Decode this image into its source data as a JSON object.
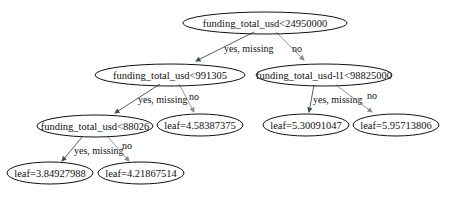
{
  "tree": {
    "nodes": [
      {
        "id": "n0",
        "label": "funding_total_usd<24950000",
        "type": "split"
      },
      {
        "id": "n1",
        "label": "funding_total_usd<991305",
        "type": "split"
      },
      {
        "id": "n2",
        "label": "funding_total_usd-l1<98825000",
        "type": "split"
      },
      {
        "id": "n3",
        "label": "funding_total_usd<88026",
        "type": "split"
      },
      {
        "id": "n4",
        "label": "leaf=4.58387375",
        "type": "leaf"
      },
      {
        "id": "n5",
        "label": "leaf=5.30091047",
        "type": "leaf"
      },
      {
        "id": "n6",
        "label": "leaf=5.95713806",
        "type": "leaf"
      },
      {
        "id": "n7",
        "label": "leaf=3.84927988",
        "type": "leaf"
      },
      {
        "id": "n8",
        "label": "leaf=4.21867514",
        "type": "leaf"
      }
    ],
    "edges": [
      {
        "from": "n0",
        "to": "n1",
        "label": "yes, missing"
      },
      {
        "from": "n0",
        "to": "n2",
        "label": "no"
      },
      {
        "from": "n1",
        "to": "n3",
        "label": "yes, missing"
      },
      {
        "from": "n1",
        "to": "n4",
        "label": "no"
      },
      {
        "from": "n2",
        "to": "n5",
        "label": "yes, missing"
      },
      {
        "from": "n2",
        "to": "n6",
        "label": "no"
      },
      {
        "from": "n3",
        "to": "n7",
        "label": "yes, missing"
      },
      {
        "from": "n3",
        "to": "n8",
        "label": "no"
      }
    ]
  },
  "colors": {
    "yes_edge": "#404a5a",
    "no_edge": "#8a8a8a",
    "node_stroke": "#111111"
  }
}
